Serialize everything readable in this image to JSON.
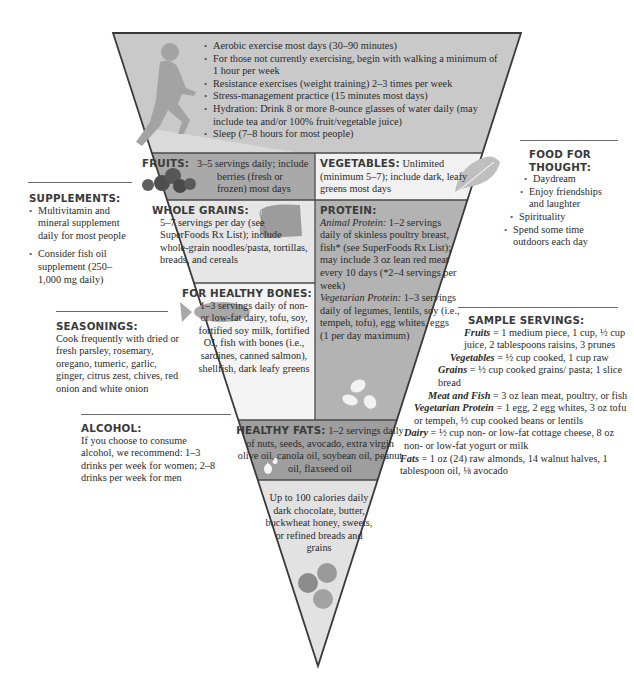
{
  "colors": {
    "activity_band": "#c9c9c9",
    "fruits_band": "#a9a9a9",
    "vegetables_band": "#f1f1f1",
    "grains_band": "#e6e6e6",
    "protein_band": "#b3b3b3",
    "bones_band": "#f4f4f4",
    "fats_band": "#9e9e9e",
    "treats_band": "#e2e2e2",
    "outline": "#3a3a3a",
    "heading": "#3a3a3a",
    "body_text": "#2a2a2a"
  },
  "pyramid": {
    "activity": {
      "icon": "runner-icon",
      "items": [
        "Aerobic exercise most days (30–90 minutes)",
        "For those not currently exercising, begin with walking a minimum of 1 hour per week",
        "Resistance exercises (weight training) 2–3 times per week",
        "Stress-management practice (15 minutes most days)",
        "Hydration: Drink 8 or more 8-ounce glasses of water daily (may include tea and/or 100% fruit/vegetable juice)",
        "Sleep (7–8 hours for most people)"
      ]
    },
    "fruits": {
      "heading": "FRUITS:",
      "text": "3–5 servings daily; include berries (fresh or frozen) most days",
      "icon": "berries-icon"
    },
    "vegetables": {
      "heading": "VEGETABLES:",
      "text": "Unlimited (minimum 5–7); include dark, leafy greens most days",
      "icon": "leaf-icon"
    },
    "whole_grains": {
      "heading": "WHOLE GRAINS:",
      "text": "5–7 servings per day (see SuperFoods Rx List); include whole-grain noodles/pasta, tortillas, breads, and cereals",
      "icon": "bread-loaf-icon"
    },
    "protein": {
      "heading": "PROTEIN:",
      "animal_label": "Animal Protein:",
      "animal_text": "1–2 servings daily of skinless poultry breast, fish* (see SuperFoods Rx List); may include 3 oz lean red meat every 10 days (*2–4 servings per week)",
      "vegetarian_label": "Vegetarian Protein:",
      "vegetarian_text": "1–3 servings daily of legumes, lentils, soy (i.e., tempeh, tofu), egg whites, eggs (1 per day maximum)",
      "icon": "beans-icon"
    },
    "healthy_bones": {
      "heading": "FOR HEALTHY BONES:",
      "text": "1–3 servings daily of non- or low-fat dairy, tofu, soy, fortified soy milk, fortified OJ, fish with bones (i.e., sardines, canned salmon), shellfish, dark leafy greens",
      "icon": "fish-icon"
    },
    "healthy_fats": {
      "heading": "HEALTHY FATS:",
      "text": "1–2 servings daily of nuts, seeds, avocado, extra virgin olive oil, canola oil, soybean oil, peanut oil, flaxseed oil",
      "icon": "oil-drops-icon"
    },
    "treats": {
      "text": "Up to 100 calories daily dark chocolate, butter, buckwheat honey, sweets, or refined breads and grains",
      "icon": "candies-icon"
    }
  },
  "sidebar_left": {
    "supplements": {
      "heading": "SUPPLEMENTS:",
      "items": [
        "Multivitamin and mineral supplement daily for most people",
        "Consider fish oil supplement (250–1,000 mg daily)"
      ]
    },
    "seasonings": {
      "heading": "SEASONINGS:",
      "text": "Cook frequently with dried or fresh parsley, rosemary, oregano, tumeric, garlic, ginger, citrus zest, chives, red onion and white onion"
    },
    "alcohol": {
      "heading": "ALCOHOL:",
      "text": "If you choose to consume alcohol, we recommend: 1–3 drinks per week for women; 2–8 drinks per week for men"
    }
  },
  "sidebar_right": {
    "food_for_thought": {
      "heading_line1": "FOOD FOR",
      "heading_line2": "THOUGHT:",
      "items": [
        "Daydream",
        "Enjoy friendships and laughter",
        "Spirituality",
        "Spend some time outdoors each day"
      ]
    },
    "sample_servings": {
      "heading": "SAMPLE SERVINGS:",
      "rows": [
        {
          "label": "Fruits",
          "text": "= 1 medium piece, 1 cup, ½ cup juice, 2 tablespoons raisins, 3 prunes"
        },
        {
          "label": "Vegetables",
          "text": "= ½ cup cooked, 1 cup raw"
        },
        {
          "label": "Grains",
          "text": "= ½ cup cooked grains/ pasta; 1 slice bread"
        },
        {
          "label": "Meat and Fish",
          "text": "= 3 oz lean meat, poultry, or fish"
        },
        {
          "label": "Vegetarian Protein",
          "text": "= 1 egg, 2 egg whites, 3 oz tofu or tempeh, ½ cup cooked beans or lentils"
        },
        {
          "label": "Dairy",
          "text": "= ½ cup non- or low-fat cottage cheese, 8 oz non- or low-fat yogurt or milk"
        },
        {
          "label": "Fats",
          "text": "= 1 oz (24) raw almonds, 14 walnut halves, 1 tablespoon oil, ⅛ avocado"
        }
      ]
    }
  }
}
